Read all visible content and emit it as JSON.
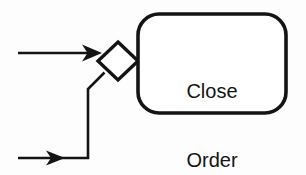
{
  "diagram": {
    "type": "flowchart",
    "background_color": "#fdfdfd",
    "stroke_color": "#141414",
    "fill_color": "#ffffff",
    "nodes": [
      {
        "id": "merge-gateway",
        "kind": "diamond",
        "name": "merge-gateway",
        "label": "",
        "center_x": 118,
        "center_y": 61,
        "half_width": 20,
        "half_height": 19,
        "stroke_width": 3.4
      },
      {
        "id": "close-order-task",
        "kind": "rounded-rectangle",
        "name": "close-order-task",
        "label_lines": [
          "Close",
          "Order"
        ],
        "x": 138,
        "y": 14,
        "width": 148,
        "height": 99,
        "corner_radius": 21,
        "stroke_width": 3.6
      }
    ],
    "connectors": [
      {
        "id": "top-inbound-flow",
        "name": "top-inbound-arrow",
        "kind": "arrow",
        "path": "M18,53 L96,53",
        "arrowhead": "solid-triangle",
        "arrow_tip_x": 101,
        "arrow_tip_y": 53,
        "stroke_width": 2.6
      },
      {
        "id": "bottom-inbound-flow",
        "name": "bottom-inbound-arrow",
        "kind": "arrow",
        "path": "M18,158 L58,158",
        "arrowhead": "solid-triangle",
        "arrow_tip_x": 64,
        "arrow_tip_y": 158,
        "stroke_width": 2.6
      },
      {
        "id": "bottom-riser-flow",
        "name": "bottom-riser-connector",
        "kind": "polyline",
        "path": "M60,158 L88,158 L88,89 L104,72",
        "arrowhead": "none",
        "stroke_width": 2.6
      }
    ]
  },
  "labels": {
    "close_order_line1": "Close",
    "close_order_line2": "Order"
  }
}
